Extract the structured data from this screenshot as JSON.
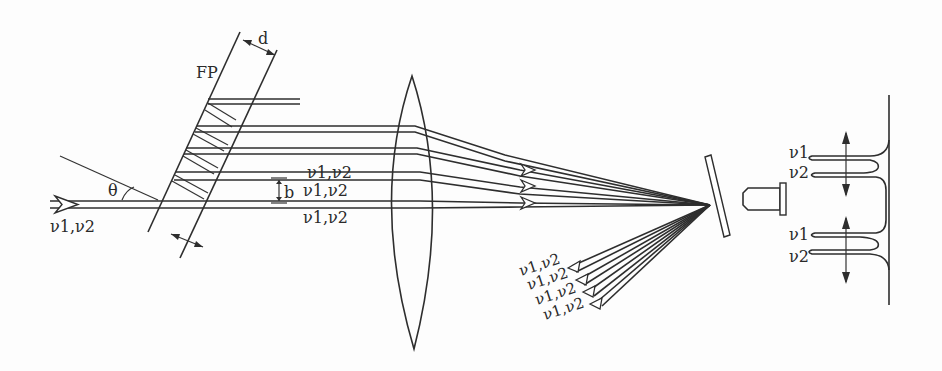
{
  "diagram": {
    "type": "optical-setup",
    "colors": {
      "line": "#2e2e2e",
      "background": "#fdfdfd"
    },
    "labels": {
      "etalon": "FP",
      "spacing": "d",
      "angle": "θ",
      "beam_separation": "b",
      "input_freqs": "ν1,ν2",
      "beam_freq_1": "ν1,ν2",
      "beam_freq_2": "ν1,ν2",
      "beam_freq_3": "ν1,ν2",
      "reflected": [
        "ν1,ν2",
        "ν1,ν2",
        "ν1,ν2",
        "ν1,ν2"
      ],
      "fringe_top_1": "ν1",
      "fringe_top_2": "ν2",
      "fringe_bottom_1": "ν1",
      "fringe_bottom_2": "ν2"
    },
    "components": [
      "input-beam",
      "fabry-perot-etalon",
      "transmitted-beams",
      "focusing-lens",
      "tilted-mirror",
      "reflected-beams",
      "detector",
      "fringe-profile"
    ]
  }
}
